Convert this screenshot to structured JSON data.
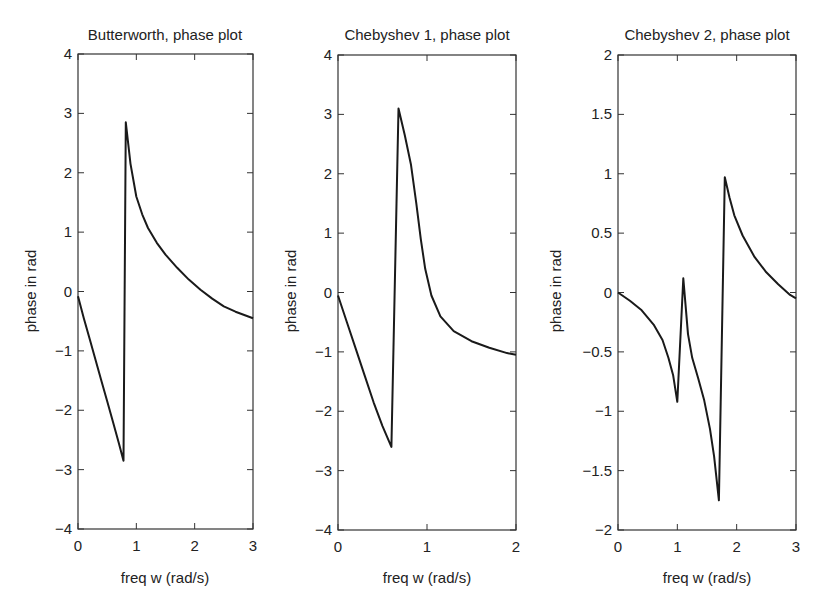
{
  "chart_data": [
    {
      "type": "line",
      "title": "Butterworth, phase plot",
      "xlabel": "freq w (rad/s)",
      "ylabel": "phase in rad",
      "xlim": [
        0,
        3
      ],
      "ylim": [
        -4,
        4
      ],
      "xticks": [
        0,
        1,
        2,
        3
      ],
      "yticks": [
        -4,
        -3,
        -2,
        -1,
        0,
        1,
        2,
        3,
        4
      ],
      "xtick_labels": [
        "0",
        "1",
        "2",
        "3"
      ],
      "ytick_labels": [
        "−4",
        "−3",
        "−2",
        "−1",
        "0",
        "1",
        "2",
        "3",
        "4"
      ],
      "grid": false,
      "frame": {
        "left": 78,
        "right": 253,
        "top": 54,
        "bottom": 529
      },
      "series": [
        {
          "name": "phase",
          "x": [
            0,
            0.1,
            0.2,
            0.3,
            0.4,
            0.5,
            0.6,
            0.7,
            0.78,
            0.82,
            0.9,
            1.0,
            1.1,
            1.2,
            1.35,
            1.5,
            1.7,
            1.9,
            2.1,
            2.3,
            2.5,
            2.7,
            3.0
          ],
          "y": [
            -0.08,
            -0.45,
            -0.8,
            -1.15,
            -1.5,
            -1.85,
            -2.2,
            -2.55,
            -2.85,
            2.85,
            2.15,
            1.6,
            1.3,
            1.07,
            0.82,
            0.62,
            0.4,
            0.2,
            0.03,
            -0.12,
            -0.25,
            -0.34,
            -0.45
          ]
        }
      ]
    },
    {
      "type": "line",
      "title": "Chebyshev 1, phase plot",
      "xlabel": "freq w (rad/s)",
      "ylabel": "phase in rad",
      "xlim": [
        0,
        2
      ],
      "ylim": [
        -4,
        4
      ],
      "xticks": [
        0,
        1,
        2
      ],
      "yticks": [
        -4,
        -3,
        -2,
        -1,
        0,
        1,
        2,
        3,
        4
      ],
      "xtick_labels": [
        "0",
        "1",
        "2"
      ],
      "ytick_labels": [
        "−4",
        "−3",
        "−2",
        "−1",
        "0",
        "1",
        "2",
        "3",
        "4"
      ],
      "minor_top_ticks": [
        0.5,
        1.0,
        1.5
      ],
      "grid": false,
      "frame": {
        "left": 338,
        "right": 516,
        "top": 55,
        "bottom": 530
      },
      "series": [
        {
          "name": "phase",
          "x": [
            0,
            0.1,
            0.2,
            0.3,
            0.4,
            0.5,
            0.6,
            0.68,
            0.75,
            0.82,
            0.88,
            0.93,
            0.98,
            1.05,
            1.15,
            1.3,
            1.5,
            1.7,
            1.9,
            2.0
          ],
          "y": [
            -0.05,
            -0.5,
            -0.95,
            -1.4,
            -1.85,
            -2.25,
            -2.6,
            3.1,
            2.65,
            2.15,
            1.5,
            0.9,
            0.4,
            -0.05,
            -0.4,
            -0.65,
            -0.82,
            -0.93,
            -1.02,
            -1.05
          ]
        }
      ]
    },
    {
      "type": "line",
      "title": "Chebyshev 2, phase plot",
      "xlabel": "freq w (rad/s)",
      "ylabel": "phase in rad",
      "xlim": [
        0,
        3
      ],
      "ylim": [
        -2,
        2
      ],
      "xticks": [
        0,
        1,
        2,
        3
      ],
      "yticks": [
        -2,
        -1.5,
        -1,
        -0.5,
        0,
        0.5,
        1,
        1.5,
        2
      ],
      "xtick_labels": [
        "0",
        "1",
        "2",
        "3"
      ],
      "ytick_labels": [
        "−2",
        "−1.5",
        "−1",
        "−0.5",
        "0",
        "0.5",
        "1",
        "1.5",
        "2"
      ],
      "grid": false,
      "frame": {
        "left": 618,
        "right": 796,
        "top": 55,
        "bottom": 530
      },
      "series": [
        {
          "name": "phase",
          "x": [
            0,
            0.2,
            0.4,
            0.6,
            0.75,
            0.85,
            0.93,
            1.0,
            1.1,
            1.18,
            1.25,
            1.35,
            1.45,
            1.55,
            1.62,
            1.7,
            1.8,
            1.88,
            1.96,
            2.1,
            2.3,
            2.5,
            2.7,
            2.9,
            3.0
          ],
          "y": [
            0.0,
            -0.07,
            -0.15,
            -0.27,
            -0.4,
            -0.55,
            -0.7,
            -0.92,
            0.12,
            -0.35,
            -0.55,
            -0.72,
            -0.9,
            -1.15,
            -1.38,
            -1.75,
            0.97,
            0.8,
            0.65,
            0.48,
            0.3,
            0.17,
            0.07,
            -0.02,
            -0.05
          ]
        }
      ]
    }
  ],
  "panels": [
    {
      "title": "Butterworth, phase plot",
      "xlabel": "freq w (rad/s)",
      "ylabel": "phase in rad"
    },
    {
      "title": "Chebyshev 1, phase plot",
      "xlabel": "freq w (rad/s)",
      "ylabel": "phase in rad"
    },
    {
      "title": "Chebyshev 2, phase plot",
      "xlabel": "freq w (rad/s)",
      "ylabel": "phase in rad"
    }
  ],
  "style": {
    "line_color": "#1a1a1a",
    "axis_color": "#333333",
    "background": "#ffffff"
  }
}
